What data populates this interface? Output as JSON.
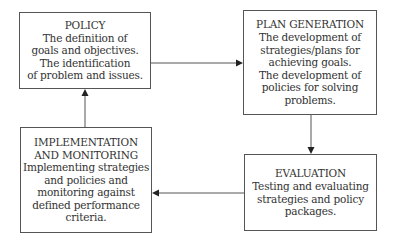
{
  "diagram": {
    "type": "cycle-flowchart",
    "colors": {
      "border": "#555555",
      "text": "#333333",
      "arrow": "#555555",
      "background": "#ffffff"
    },
    "nodes": {
      "policy": {
        "title": "POLICY",
        "lines": [
          "The definition of",
          "goals and objectives.",
          "The identification",
          "of problem and issues."
        ]
      },
      "plan_generation": {
        "title": "PLAN GENERATION",
        "lines": [
          "The development of",
          "strategies/plans for",
          "achieving goals.",
          "The development of",
          "policies for solving",
          "problems."
        ]
      },
      "evaluation": {
        "title": "EVALUATION",
        "lines": [
          "Testing and evaluating",
          "strategies and policy",
          "packages."
        ]
      },
      "implementation": {
        "title_lines": [
          "IMPLEMENTATION",
          "AND MONITORING"
        ],
        "lines": [
          "Implementing strategies",
          "and policies and",
          "monitoring against",
          "defined performance",
          "criteria."
        ]
      }
    },
    "edges": [
      {
        "from": "policy",
        "to": "plan_generation"
      },
      {
        "from": "plan_generation",
        "to": "evaluation"
      },
      {
        "from": "evaluation",
        "to": "implementation"
      },
      {
        "from": "implementation",
        "to": "policy"
      }
    ]
  }
}
